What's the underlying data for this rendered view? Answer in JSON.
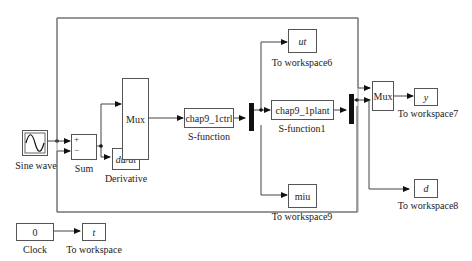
{
  "diagram": {
    "type": "simulink-model",
    "blocks": {
      "sine": {
        "label": "Sine wave"
      },
      "sum": {
        "label": "Sum",
        "port_plus": "+",
        "port_minus": "−"
      },
      "derivative": {
        "text": "du/dt",
        "label": "Derivative"
      },
      "mux1": {
        "text": "Mux"
      },
      "ctrl": {
        "text": "chap9_1ctrl",
        "label": "S-function"
      },
      "plant": {
        "text": "chap9_1plant",
        "label": "S-function1"
      },
      "mux2": {
        "text": "Mux"
      },
      "ws_ut": {
        "text": "ut",
        "label": "To workspace6"
      },
      "ws_miu": {
        "text": "miu",
        "label": "To workspace9"
      },
      "ws_y": {
        "text": "y",
        "label": "To workspace7"
      },
      "ws_d": {
        "text": "d",
        "label": "To workspace8"
      },
      "clock": {
        "text": "0",
        "label": "Clock"
      },
      "ws_t": {
        "text": "t",
        "label": "To workspace"
      }
    },
    "connections": [
      [
        "Sine wave",
        "Sum(+)"
      ],
      [
        "Sine wave",
        "Mux(2) in1"
      ],
      [
        "Sum",
        "Mux in1"
      ],
      [
        "Sum",
        "Derivative"
      ],
      [
        "Derivative",
        "Mux in2"
      ],
      [
        "Mux",
        "S-function"
      ],
      [
        "S-function",
        "Demux1"
      ],
      [
        "Demux1",
        "To workspace6"
      ],
      [
        "Demux1",
        "S-function1"
      ],
      [
        "Demux1",
        "To workspace9"
      ],
      [
        "S-function1",
        "Demux2"
      ],
      [
        "Demux2",
        "Mux(2) in2"
      ],
      [
        "Demux2",
        "To workspace8"
      ],
      [
        "Demux2",
        "Sum(-)"
      ],
      [
        "Mux(2)",
        "To workspace7"
      ],
      [
        "Clock",
        "To workspace"
      ]
    ]
  }
}
